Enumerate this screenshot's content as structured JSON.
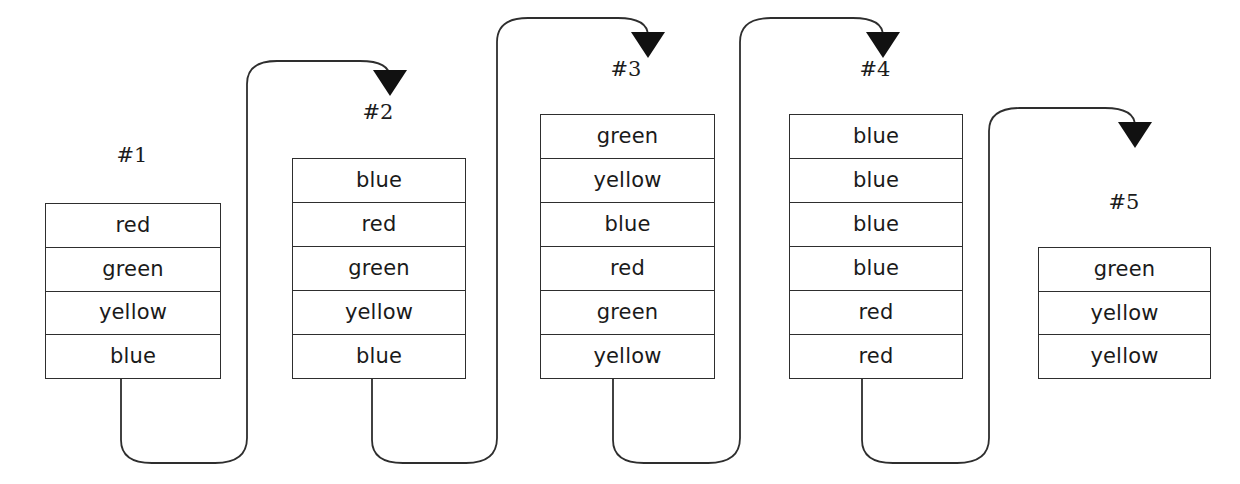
{
  "diagram": {
    "background_color": "#ffffff",
    "line_color": "#2e2e2e",
    "text_color": "#1a1a1a",
    "stacks": [
      {
        "label": "#1",
        "label_x": 132,
        "label_y": 143,
        "x": 45,
        "y": 203,
        "width": 176,
        "height": 176,
        "items": [
          "red",
          "green",
          "yellow",
          "blue"
        ]
      },
      {
        "label": "#2",
        "label_x": 378,
        "label_y": 100,
        "x": 292,
        "y": 158,
        "width": 174,
        "height": 221,
        "items": [
          "blue",
          "red",
          "green",
          "yellow",
          "blue"
        ]
      },
      {
        "label": "#3",
        "label_x": 626,
        "label_y": 57,
        "x": 540,
        "y": 114,
        "width": 175,
        "height": 265,
        "items": [
          "green",
          "yellow",
          "blue",
          "red",
          "green",
          "yellow"
        ]
      },
      {
        "label": "#4",
        "label_x": 875,
        "label_y": 57,
        "x": 789,
        "y": 114,
        "width": 174,
        "height": 265,
        "items": [
          "blue",
          "blue",
          "blue",
          "blue",
          "red",
          "red"
        ]
      },
      {
        "label": "#5",
        "label_x": 1124,
        "label_y": 190,
        "x": 1038,
        "y": 247,
        "width": 173,
        "height": 132,
        "items": [
          "green",
          "yellow",
          "yellow"
        ]
      }
    ],
    "connectors": [
      {
        "name": "connector-1-to-2",
        "from_stack": "#1",
        "to_stack": "#2",
        "path": "M 121 379 L 121 440 Q 121 463 152 463 L 215 463 Q 247 463 247 438 L 247 84 Q 247 61 277 61 L 360 61 Q 390 61 390 78 L 390 84",
        "arrow_x": 390,
        "arrow_y": 96
      },
      {
        "name": "connector-2-to-3",
        "from_stack": "#2",
        "to_stack": "#3",
        "path": "M 372 379 L 372 440 Q 372 463 403 463 L 466 463 Q 497 463 497 438 L 497 42 Q 497 18 528 18 L 618 18 Q 648 18 648 36 L 648 44",
        "arrow_x": 648,
        "arrow_y": 58
      },
      {
        "name": "connector-3-to-4",
        "from_stack": "#3",
        "to_stack": "#4",
        "path": "M 613 379 L 613 440 Q 613 463 644 463 L 708 463 Q 740 463 740 438 L 740 42 Q 740 18 771 18 L 853 18 Q 883 18 883 36 L 883 44",
        "arrow_x": 883,
        "arrow_y": 58
      },
      {
        "name": "connector-4-to-5",
        "from_stack": "#4",
        "to_stack": "#5",
        "path": "M 862 379 L 862 440 Q 862 463 893 463 L 957 463 Q 989 463 989 438 L 989 131 Q 989 108 1020 108 L 1105 108 Q 1135 108 1135 126 L 1135 134",
        "arrow_x": 1135,
        "arrow_y": 148
      }
    ]
  }
}
